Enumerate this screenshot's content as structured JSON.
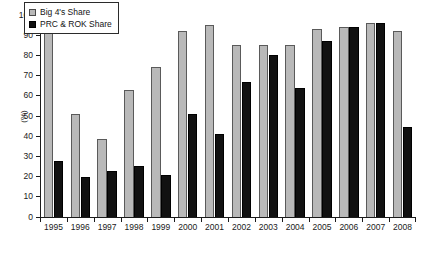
{
  "chart_data": {
    "type": "bar",
    "title": "",
    "xlabel": "",
    "ylabel": "(%)",
    "ylim": [
      0,
      100
    ],
    "yticks": [
      0,
      10,
      20,
      30,
      40,
      50,
      60,
      70,
      80,
      90,
      100
    ],
    "grid": false,
    "legend_position": "upper-left-inside",
    "categories": [
      "1995",
      "1996",
      "1997",
      "1998",
      "1999",
      "2000",
      "2001",
      "2002",
      "2003",
      "2004",
      "2005",
      "2006",
      "2007",
      "2008"
    ],
    "series": [
      {
        "name": "Big 4's Share",
        "color": "#b9b9b9",
        "values": [
          97,
          51,
          38.5,
          63,
          74.5,
          92,
          95,
          85,
          85,
          85,
          93,
          94,
          96,
          92
        ]
      },
      {
        "name": "PRC & ROK Share",
        "color": "#111111",
        "values": [
          27.5,
          20,
          23,
          25.5,
          21,
          51,
          41,
          67,
          80,
          64,
          87,
          94,
          96,
          44.5
        ]
      }
    ]
  },
  "legend": {
    "items": [
      {
        "label": "Big 4's Share",
        "swatch": "gray"
      },
      {
        "label": "PRC & ROK Share",
        "swatch": "black"
      }
    ]
  },
  "axes": {
    "y_axis_label": "(%)"
  }
}
